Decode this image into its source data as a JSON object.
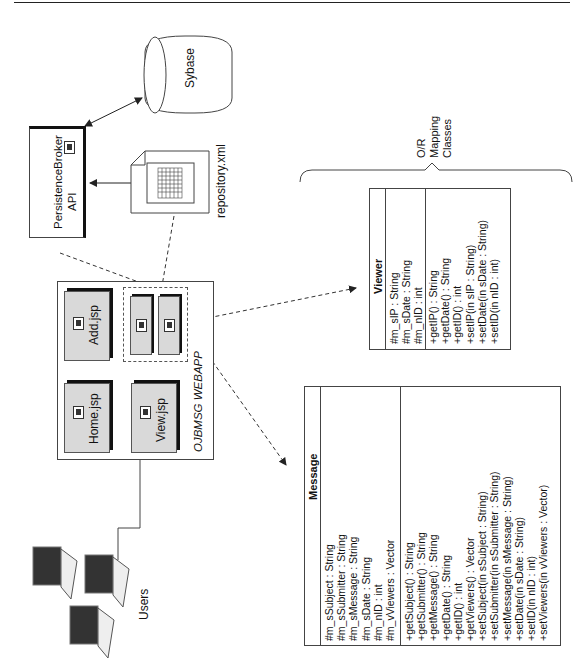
{
  "diagram": {
    "orientation": "rotated -90deg",
    "nodes": {
      "database": {
        "label": "Sybase"
      },
      "persistence_broker": {
        "label_line1": "PersistenceBroker",
        "label_line2": "API"
      },
      "repository": {
        "label": "repository.xml"
      },
      "webapp": {
        "label": "OJBMSG WEBAPP",
        "pages": [
          "Home.jsp",
          "Add.jsp",
          "View.jsp"
        ]
      },
      "users": {
        "label": "Users"
      },
      "om_group": {
        "label_line1": "O/R",
        "label_line2": "Mapping",
        "label_line3": "Classes"
      }
    },
    "classes": {
      "viewer": {
        "name": "Viewer",
        "attributes": [
          "#m_sIP : String",
          "#m_sDate : String",
          "#m_nID : int"
        ],
        "methods": [
          "+getIP() : String",
          "+getDate() : String",
          "+getID() : int",
          "+setIP(in sIP : String)",
          "+setDate(in sDate : String)",
          "+setID(in nID : int)"
        ]
      },
      "message": {
        "name": "Message",
        "attributes": [
          "#m_sSubject : String",
          "#m_sSubmitter : String",
          "#m_sMessage : String",
          "#m_sDate : String",
          "#m_nID : int",
          "#m_vViewers : Vector"
        ],
        "methods": [
          "+getSubject() : String",
          "+getSubmitter() : String",
          "+getMessage() : String",
          "+getDate() : String",
          "+getID() : int",
          "+getViewers() : Vector",
          "+setSubject(in sSubject : String)",
          "+setSubmitter(in sSubmitter : String)",
          "+setMessage(in sMessage : String)",
          "+setDate(in sDate : String)",
          "+setID(in nID : int)",
          "+setViewers(in vViewers : Vector)"
        ]
      }
    }
  }
}
